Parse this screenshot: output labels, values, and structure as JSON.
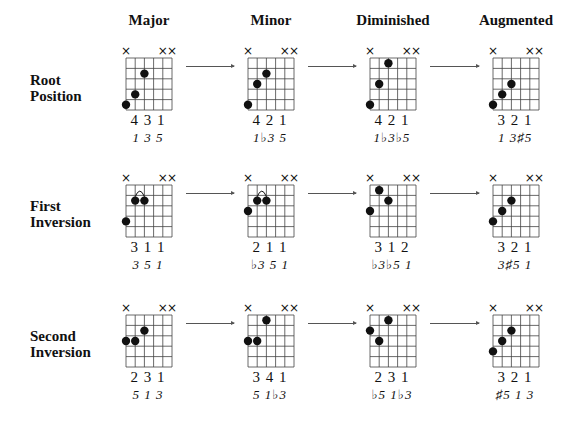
{
  "columns": [
    {
      "label": "Major"
    },
    {
      "label": "Minor"
    },
    {
      "label": "Diminished"
    },
    {
      "label": "Augmented"
    }
  ],
  "rows": [
    {
      "label_line1": "Root",
      "label_line2": "Position"
    },
    {
      "label_line1": "First",
      "label_line2": "Inversion"
    },
    {
      "label_line1": "Second",
      "label_line2": "Inversion"
    }
  ],
  "muted_marker": "×",
  "muted_strings": [
    1,
    5,
    6
  ],
  "chords": [
    [
      {
        "fingers": "431",
        "intervals": "1 3 5",
        "dots": [
          [
            1,
            5
          ],
          [
            2,
            4
          ],
          [
            3,
            2
          ]
        ],
        "barre": null
      },
      {
        "fingers": "421",
        "intervals": "1♭3 5",
        "dots": [
          [
            1,
            5
          ],
          [
            2,
            3
          ],
          [
            3,
            2
          ]
        ],
        "barre": null
      },
      {
        "fingers": "421",
        "intervals": "1♭3♭5",
        "dots": [
          [
            1,
            5
          ],
          [
            2,
            3
          ],
          [
            3,
            1
          ]
        ],
        "barre": null
      },
      {
        "fingers": "321",
        "intervals": "1 3♯5",
        "dots": [
          [
            1,
            5
          ],
          [
            2,
            4
          ],
          [
            3,
            3
          ]
        ],
        "barre": null
      }
    ],
    [
      {
        "fingers": "311",
        "intervals": "3 5 1",
        "dots": [
          [
            1,
            4
          ],
          [
            2,
            2
          ],
          [
            3,
            2
          ]
        ],
        "barre": [
          2,
          3
        ]
      },
      {
        "fingers": "211",
        "intervals": "♭3 5 1",
        "dots": [
          [
            1,
            3
          ],
          [
            2,
            2
          ],
          [
            3,
            2
          ]
        ],
        "barre": [
          2,
          3
        ]
      },
      {
        "fingers": "312",
        "intervals": "♭3♭5 1",
        "dots": [
          [
            1,
            3
          ],
          [
            2,
            1
          ],
          [
            3,
            2
          ]
        ],
        "barre": null
      },
      {
        "fingers": "321",
        "intervals": "3♯5 1",
        "dots": [
          [
            1,
            4
          ],
          [
            2,
            3
          ],
          [
            3,
            2
          ]
        ],
        "barre": null
      }
    ],
    [
      {
        "fingers": "231",
        "intervals": "5 1 3",
        "dots": [
          [
            1,
            3
          ],
          [
            2,
            3
          ],
          [
            3,
            2
          ]
        ],
        "barre": null
      },
      {
        "fingers": "341",
        "intervals": "5 1♭3",
        "dots": [
          [
            1,
            3
          ],
          [
            2,
            3
          ],
          [
            3,
            1
          ]
        ],
        "barre": null
      },
      {
        "fingers": "231",
        "intervals": "♭5 1♭3",
        "dots": [
          [
            1,
            2
          ],
          [
            2,
            3
          ],
          [
            3,
            1
          ]
        ],
        "barre": null
      },
      {
        "fingers": "321",
        "intervals": "♯5 1 3",
        "dots": [
          [
            1,
            4
          ],
          [
            2,
            3
          ],
          [
            3,
            2
          ]
        ],
        "barre": null
      }
    ]
  ],
  "colors": {
    "ink": "#111111",
    "grid": "#444444",
    "arrow": "#555555"
  }
}
